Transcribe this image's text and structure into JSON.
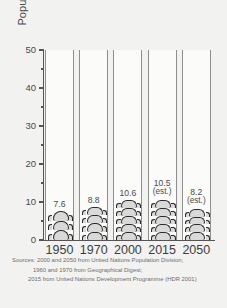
{
  "chart_data": {
    "type": "bar",
    "title": "",
    "subtitle": "",
    "xlabel": "",
    "ylabel": "Population (millions)",
    "categories": [
      "1950",
      "1970",
      "2000",
      "2015",
      "2050"
    ],
    "values": [
      7.6,
      8.8,
      10.6,
      10.5,
      8.2
    ],
    "value_labels": [
      "7.6",
      "8.8",
      "10.6",
      "10.5",
      "8.2"
    ],
    "estimate_flags": [
      false,
      false,
      false,
      true,
      true
    ],
    "estimate_note": "(est.)",
    "ylim": [
      0,
      50
    ],
    "y_ticks_major": [
      0,
      10,
      20,
      30,
      40,
      50
    ],
    "y_tick_labels": [
      "0",
      "10",
      "20",
      "30",
      "40",
      "50"
    ],
    "y_ticks_minor": [
      5,
      15,
      25,
      35,
      45
    ],
    "grid": false,
    "legend": "none",
    "bar_style": "stacked-human-figures",
    "colors": {
      "background": "#f2f2f0",
      "column_fill": "#fbfbfa",
      "column_border": "#8e8e8e",
      "figure_fill": "#d9d9d9",
      "figure_outline": "#2b2b2b",
      "axis": "#555555",
      "text": "#4a4a4a",
      "source_text": "#6d6d6d"
    }
  },
  "axis": {
    "y_title": "Population (millions)"
  },
  "sources": {
    "line1": "Sources: 2000 and 2050 from United Nations Population Division;",
    "line2": "1960 and 1970 from Geographical Digest;",
    "line3": "2015 from United Nations Development Programme (HDR 2001)"
  }
}
